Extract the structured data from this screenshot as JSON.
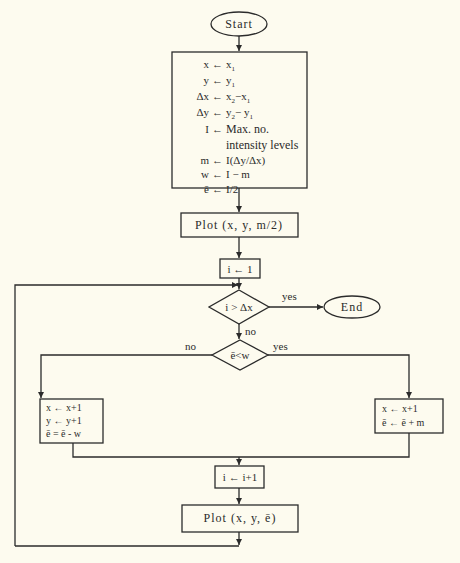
{
  "diagram": {
    "type": "flowchart",
    "colors": {
      "background": "#fdfbef",
      "ink": "#2b2b2b"
    },
    "start": {
      "label": "Start"
    },
    "end": {
      "label": "End"
    },
    "init_box": {
      "lines": [
        {
          "lhs": "x",
          "op": "←",
          "rhs": "x1"
        },
        {
          "lhs": "y",
          "op": "←",
          "rhs": "y1"
        },
        {
          "lhs": "Δx",
          "op": "←",
          "rhs": "x2 − x1"
        },
        {
          "lhs": "Δy",
          "op": "←",
          "rhs": "y2 − y1"
        },
        {
          "lhs": "I",
          "op": "←",
          "rhs": "Max. no."
        },
        {
          "lhs": "",
          "op": "",
          "rhs": "intensity levels"
        },
        {
          "lhs": "m",
          "op": "←",
          "rhs": "I(Δy/Δx)"
        },
        {
          "lhs": "w",
          "op": "←",
          "rhs": "I − m"
        },
        {
          "lhs": "ē",
          "op": "←",
          "rhs": "I/2"
        }
      ]
    },
    "plot_initial": {
      "label": "Plot (x, y, m/2)"
    },
    "loop_init": {
      "label": "i ← 1"
    },
    "decision_loop": {
      "label": "i > Δx",
      "yes": "yes",
      "no": "no"
    },
    "decision_error": {
      "label": "ē<w",
      "yes": "yes",
      "no": "no"
    },
    "left_box": {
      "lines": [
        "x ← x+1",
        "y ← y+1",
        "ē = ē - w"
      ]
    },
    "right_box": {
      "lines": [
        "x ← x+1",
        "ē ← ē + m"
      ]
    },
    "increment": {
      "label": "i ← i+1"
    },
    "plot_loop": {
      "label": "Plot (x, y, ē)"
    }
  }
}
